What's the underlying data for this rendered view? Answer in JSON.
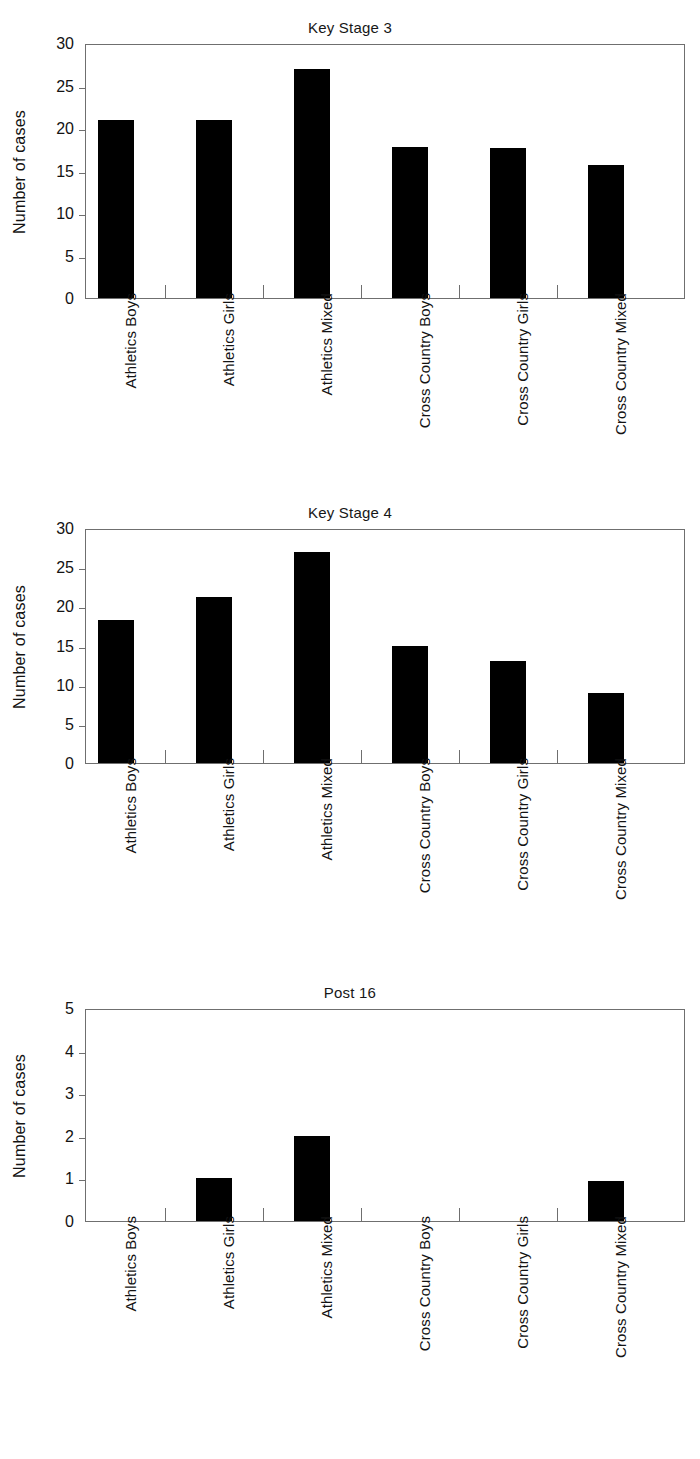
{
  "figure": {
    "ylabel": "Number of cases",
    "categories": [
      "Athletics Boys",
      "Athletics Girls",
      "Athletics Mixed",
      "Cross Country Boys",
      "Cross Country Girls",
      "Cross Country Mixed"
    ],
    "bar_color": "#000000",
    "axis_color": "#6f6f6f"
  },
  "chart_data": [
    {
      "type": "bar",
      "title": "Key Stage 3",
      "xlabel": "",
      "ylabel": "Number of cases",
      "categories": [
        "Athletics Boys",
        "Athletics Girls",
        "Athletics Mixed",
        "Cross Country Boys",
        "Cross Country Girls",
        "Cross Country Mixed"
      ],
      "values": [
        21,
        21,
        27,
        17.8,
        17.7,
        15.7
      ],
      "ylim": [
        0,
        30
      ],
      "yticks": [
        0,
        5,
        10,
        15,
        20,
        25,
        30
      ],
      "ytick_labels": [
        "0",
        "5",
        "10",
        "15",
        "20",
        "25",
        "30"
      ],
      "grid": false,
      "legend": null
    },
    {
      "type": "bar",
      "title": "Key Stage 4",
      "xlabel": "",
      "ylabel": "Number of cases",
      "categories": [
        "Athletics Boys",
        "Athletics Girls",
        "Athletics Mixed",
        "Cross Country Boys",
        "Cross Country Girls",
        "Cross Country Mixed"
      ],
      "values": [
        18.2,
        21.2,
        27,
        15,
        13,
        9
      ],
      "ylim": [
        0,
        30
      ],
      "yticks": [
        0,
        5,
        10,
        15,
        20,
        25,
        30
      ],
      "ytick_labels": [
        "0",
        "5",
        "10",
        "15",
        "20",
        "25",
        "30"
      ],
      "grid": false,
      "legend": null
    },
    {
      "type": "bar",
      "title": "Post 16",
      "xlabel": "",
      "ylabel": "Number of cases",
      "categories": [
        "Athletics Boys",
        "Athletics Girls",
        "Athletics Mixed",
        "Cross Country Boys",
        "Cross Country Girls",
        "Cross Country Mixed"
      ],
      "values": [
        0,
        1,
        2,
        0,
        0,
        0.95
      ],
      "ylim": [
        0,
        5
      ],
      "yticks": [
        0,
        1,
        2,
        3,
        4,
        5
      ],
      "ytick_labels": [
        "0",
        "1",
        "2",
        "3",
        "4",
        "5"
      ],
      "grid": false,
      "legend": null
    }
  ]
}
